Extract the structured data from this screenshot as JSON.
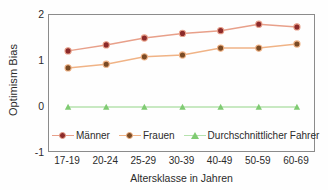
{
  "chart_data": {
    "type": "line",
    "title": "",
    "xlabel": "Altersklasse in Jahren",
    "ylabel": "Optimism Bias",
    "categories": [
      "17-19",
      "20-24",
      "25-29",
      "30-39",
      "40-49",
      "50-59",
      "60-69"
    ],
    "ylim": [
      -1,
      2
    ],
    "yticks": [
      2,
      1,
      0,
      -1
    ],
    "ytick_labels": [
      "2",
      "1",
      "0",
      "-1"
    ],
    "grid": false,
    "legend_position": "inside-bottom-left",
    "series": [
      {
        "name": "Männer",
        "values": [
          1.22,
          1.35,
          1.5,
          1.6,
          1.66,
          1.8,
          1.74
        ],
        "line_color": "#E8A08A",
        "marker_color": "#8C2A2A",
        "marker": "circle"
      },
      {
        "name": "Frauen",
        "values": [
          0.85,
          0.93,
          1.09,
          1.13,
          1.28,
          1.28,
          1.37
        ],
        "line_color": "#F0B386",
        "marker_color": "#7A4A24",
        "marker": "circle"
      },
      {
        "name": "Durchschnittlicher Fahrer",
        "values": [
          0,
          0,
          0,
          0,
          0,
          0,
          0
        ],
        "line_color": "#B6E2AE",
        "marker_color": "#7FCB72",
        "marker": "triangle"
      }
    ]
  },
  "axes": {
    "border_color": "#8B8B8B",
    "text_color": "#2B2B2B"
  }
}
